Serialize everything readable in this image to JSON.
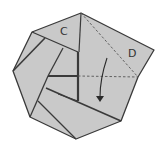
{
  "diagram": {
    "type": "origami-fold-step",
    "colors": {
      "paper": "#c9c9c9",
      "edge": "#3a3a3a",
      "crease": "#555555",
      "background": "#ffffff"
    },
    "labels": {
      "flap_c": "C",
      "flap_d": "D"
    },
    "arrow": {
      "direction": "down",
      "meaning": "fold-down"
    },
    "lines": {
      "dashed_diagonal": "valley-fold-diagonal",
      "dashed_horizontal": "valley-fold-horizontal"
    }
  }
}
